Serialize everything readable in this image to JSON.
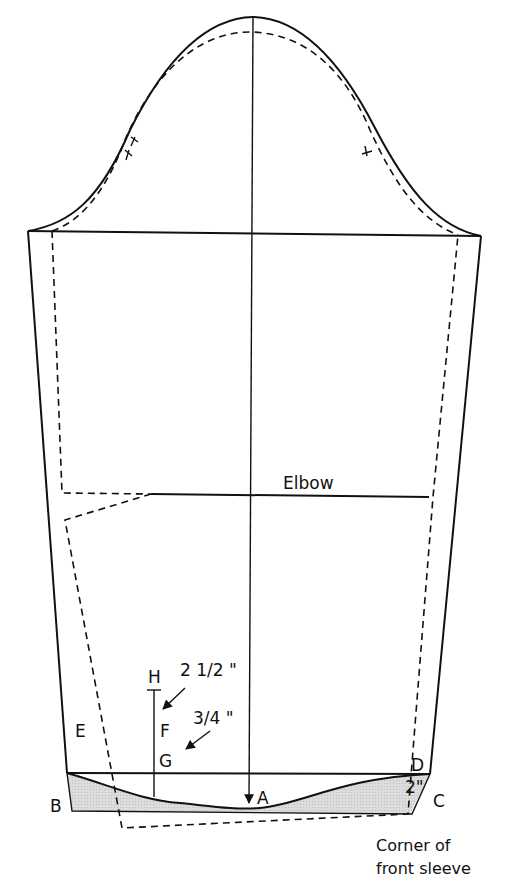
{
  "diagram": {
    "colors": {
      "line": "#111111",
      "shading": "#d9d9d9",
      "background": "#ffffff"
    },
    "labels": {
      "elbow": "Elbow",
      "h": "H",
      "f": "F",
      "g": "G",
      "e": "E",
      "d": "D",
      "a": "A",
      "b": "B",
      "c": "C",
      "measure_hf": "2 1/2 \"",
      "measure_fg": "3/4 \"",
      "measure_dc": "2\"",
      "caption_line1": "Corner of",
      "caption_line2": "front sleeve"
    },
    "notches": {
      "back": "double-notch",
      "front": "single-notch"
    }
  }
}
